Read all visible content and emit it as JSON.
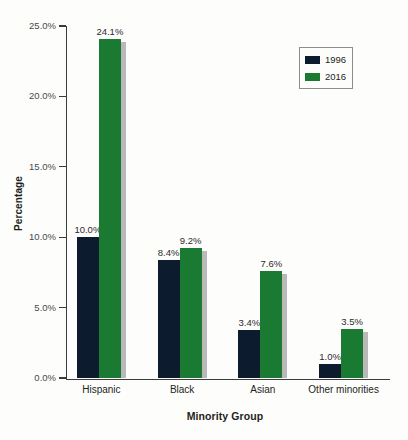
{
  "chart_data": {
    "type": "bar",
    "title": "",
    "subtitle": "",
    "xlabel": "Minority Group",
    "ylabel": "Percentage",
    "categories": [
      "Hispanic",
      "Black",
      "Asian",
      "Other minorities"
    ],
    "series": [
      {
        "name": "1996",
        "color": "#0d1b2e",
        "values": [
          10.0,
          8.4,
          3.4,
          1.0
        ],
        "labels": [
          "10.0%",
          "8.4%",
          "3.4%",
          "1.0%"
        ]
      },
      {
        "name": "2016",
        "color": "#1a7a32",
        "values": [
          24.1,
          9.2,
          7.6,
          3.5
        ],
        "labels": [
          "24.1%",
          "9.2%",
          "7.6%",
          "3.5%"
        ]
      }
    ],
    "ylim": [
      0,
      25
    ],
    "yticks": [
      0,
      5,
      10,
      15,
      20,
      25
    ],
    "ytick_labels": [
      "0.0%",
      "5.0%",
      "10.0%",
      "15.0%",
      "20.0%",
      "25.0%"
    ],
    "grid": false,
    "legend_position": "top-right",
    "shadow_color": "#b9b9b9",
    "axis_color": "#3b3b3b"
  },
  "legend": {
    "entries": [
      {
        "label": "1996",
        "color": "#0d1b2e"
      },
      {
        "label": "2016",
        "color": "#1a7a32"
      }
    ]
  }
}
